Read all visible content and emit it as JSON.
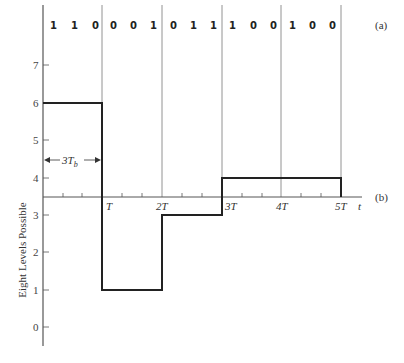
{
  "figure": {
    "part_a_label": "(a)",
    "part_b_label": "(b)",
    "bit_groups": [
      [
        "1",
        "1",
        "0"
      ],
      [
        "0",
        "0",
        "1"
      ],
      [
        "0",
        "1",
        "1"
      ],
      [
        "1",
        "0",
        "0"
      ],
      [
        "1",
        "0",
        "0"
      ]
    ],
    "y_axis": {
      "label": "Eight Levels Possible",
      "ticks": [
        "0",
        "1",
        "2",
        "3",
        "4",
        "5",
        "6",
        "7"
      ]
    },
    "x_axis": {
      "label": "t",
      "ticks": [
        "T",
        "2T",
        "3T",
        "4T",
        "5T"
      ]
    },
    "annotation": {
      "symbol_duration_main": "3T",
      "symbol_duration_sub": "b"
    },
    "levels": [
      6,
      1,
      3,
      4,
      4
    ]
  }
}
